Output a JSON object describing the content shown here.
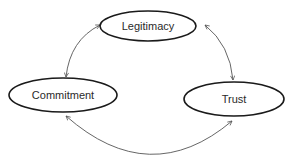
{
  "diagram": {
    "type": "cycle",
    "nodes": [
      {
        "id": "legitimacy",
        "label": "Legitimacy"
      },
      {
        "id": "commitment",
        "label": "Commitment"
      },
      {
        "id": "trust",
        "label": "Trust"
      }
    ],
    "edges": [
      {
        "from": "legitimacy",
        "to": "commitment",
        "direction": "bidirectional"
      },
      {
        "from": "legitimacy",
        "to": "trust",
        "direction": "bidirectional"
      },
      {
        "from": "commitment",
        "to": "trust",
        "direction": "bidirectional"
      }
    ],
    "colors": {
      "node_stroke": "#1a1a1a",
      "edge_stroke": "#555555",
      "text": "#2a2a2a",
      "background": "#ffffff"
    }
  }
}
